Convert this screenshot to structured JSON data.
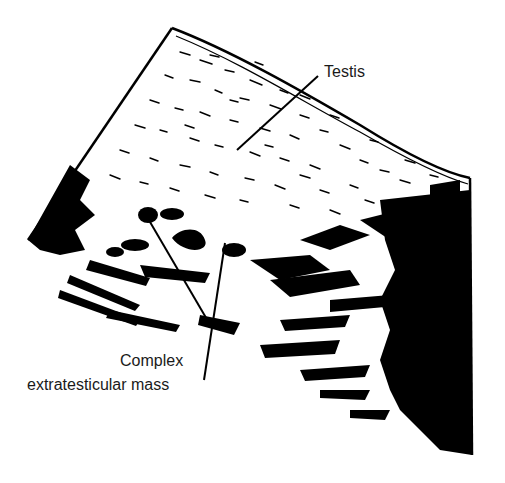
{
  "figure": {
    "type": "ultrasound illustration",
    "colors": {
      "ink": "#000000",
      "background": "#ffffff",
      "text": "#1a1a1a"
    }
  },
  "labels": {
    "testis": "Testis",
    "mass_line1": "Complex",
    "mass_line2": "extratesticular mass"
  }
}
